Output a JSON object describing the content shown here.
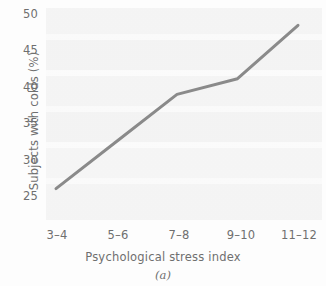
{
  "chart_data": {
    "type": "line",
    "title": "",
    "subtitle": "",
    "xlabel": "Psychological stress index",
    "ylabel": "Subjects with colds (%)",
    "caption": "(a)",
    "categories": [
      "3–4",
      "5–6",
      "7–8",
      "9–10",
      "11–12"
    ],
    "values": [
      27,
      33,
      39,
      41,
      47.8
    ],
    "series": [
      {
        "name": "Subjects with colds",
        "values": [
          27,
          33,
          39,
          41,
          47.8
        ]
      }
    ],
    "ylim": [
      23,
      50
    ],
    "yticks": [
      25,
      30,
      35,
      40,
      45,
      50
    ],
    "ytick_labels": [
      "25",
      "30",
      "35",
      "40",
      "45",
      "50"
    ],
    "xtick_labels": [
      "3–4",
      "5–6",
      "7–8",
      "9–10",
      "11–12"
    ],
    "grid": true,
    "grid_axis": "y",
    "legend": false,
    "legend_position": "none",
    "line_color": "#8a8a8a",
    "line_width": 3,
    "markers": false,
    "background_color": "#f5f5f5",
    "text_color": "#6f6f6f"
  }
}
